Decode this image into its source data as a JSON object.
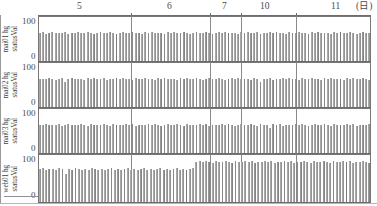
{
  "figure": {
    "kind": "multi-panel-bar-chart",
    "appearance": "grayscale scanned fax",
    "y_axis_top_label": "100",
    "y_axis_bottom_label": "0",
    "x_axis_position": "top",
    "x_axis_unit_label": "(日)"
  },
  "top_axis": {
    "ticks": [
      {
        "label": "5",
        "x": 80
      },
      {
        "label": "6",
        "x": 170
      },
      {
        "label": "7",
        "x": 225
      },
      {
        "label": "10",
        "x": 265
      },
      {
        "label": "11",
        "x": 335
      },
      {
        "label": "(日)",
        "x": 362
      }
    ],
    "gridline_positions": [
      131,
      210,
      241,
      296
    ]
  },
  "panels": [
    {
      "label_line1": "mai01 hg",
      "label_line2": "statusVal",
      "y_top": "100",
      "y_bottom": "0"
    },
    {
      "label_line1": "mai02 hg",
      "label_line2": "statusVal",
      "y_top": "100",
      "y_bottom": "0"
    },
    {
      "label_line1": "mai03 hg",
      "label_line2": "statusVal",
      "y_top": "100",
      "y_bottom": "0"
    },
    {
      "label_line1": "web01 hg",
      "label_line2": "statusVal",
      "y_top": "100",
      "y_bottom": "0"
    }
  ],
  "colors": {
    "bar_light": "#cfcfcf",
    "bar_mid": "#9a9a9a",
    "bar_dark": "#7f7f7f",
    "axis": "#777777",
    "grid": "#8a8a8a",
    "text": "#3f3f3f",
    "background": "#ffffff"
  },
  "chart_data": {
    "type": "bar",
    "title": "",
    "subtitle": "",
    "xlabel": "(日)",
    "ylabel": "statusVal",
    "ylim": [
      0,
      100
    ],
    "grid": true,
    "legend": "none",
    "x_tick_labels": [
      "5",
      "6",
      "7",
      "10",
      "11"
    ],
    "n_bars_per_panel": 104,
    "series": [
      {
        "name": "mai01 hg statusVal",
        "ylim": [
          0,
          100
        ],
        "values": [
          66,
          68,
          64,
          67,
          69,
          65,
          67,
          66,
          68,
          64,
          67,
          66,
          69,
          65,
          67,
          68,
          66,
          64,
          67,
          69,
          66,
          65,
          68,
          67,
          64,
          66,
          69,
          67,
          65,
          68,
          66,
          67,
          64,
          69,
          66,
          68,
          65,
          67,
          66,
          64,
          68,
          67,
          69,
          65,
          66,
          68,
          67,
          64,
          66,
          69,
          67,
          65,
          68,
          66,
          64,
          67,
          69,
          66,
          68,
          65,
          67,
          66,
          64,
          68,
          67,
          69,
          65,
          66,
          68,
          64,
          67,
          66,
          69,
          65,
          68,
          67,
          66,
          64,
          69,
          67,
          65,
          68,
          66,
          67,
          64,
          69,
          66,
          68,
          65,
          67,
          66,
          64,
          68,
          67,
          69,
          65,
          66,
          68,
          67,
          64,
          66,
          69,
          67,
          65
        ]
      },
      {
        "name": "mai02 hg statusVal",
        "ylim": [
          0,
          100
        ],
        "values": [
          66,
          67,
          65,
          68,
          66,
          64,
          67,
          69,
          58,
          66,
          68,
          65,
          67,
          66,
          64,
          68,
          67,
          69,
          65,
          66,
          68,
          64,
          67,
          66,
          69,
          65,
          68,
          67,
          66,
          64,
          69,
          67,
          65,
          68,
          66,
          67,
          64,
          69,
          66,
          68,
          65,
          67,
          66,
          64,
          68,
          67,
          69,
          65,
          66,
          68,
          67,
          64,
          66,
          69,
          67,
          65,
          68,
          66,
          64,
          67,
          69,
          66,
          68,
          65,
          67,
          66,
          64,
          68,
          67,
          60,
          65,
          66,
          68,
          64,
          67,
          66,
          69,
          65,
          68,
          67,
          66,
          64,
          69,
          67,
          65,
          68,
          66,
          67,
          64,
          69,
          66,
          68,
          65,
          67,
          66,
          64,
          68,
          67,
          69,
          65,
          66,
          68,
          67,
          64
        ]
      },
      {
        "name": "mai03 hg statusVal",
        "ylim": [
          0,
          100
        ],
        "values": [
          67,
          66,
          68,
          65,
          67,
          66,
          69,
          64,
          67,
          68,
          66,
          65,
          67,
          69,
          66,
          64,
          68,
          67,
          65,
          66,
          69,
          67,
          64,
          68,
          66,
          67,
          65,
          69,
          66,
          68,
          64,
          67,
          66,
          65,
          68,
          67,
          69,
          66,
          64,
          67,
          68,
          65,
          66,
          69,
          67,
          64,
          68,
          66,
          67,
          65,
          69,
          66,
          68,
          64,
          67,
          66,
          65,
          68,
          67,
          69,
          66,
          64,
          67,
          68,
          65,
          66,
          69,
          67,
          64,
          68,
          66,
          67,
          58,
          69,
          66,
          68,
          64,
          67,
          66,
          65,
          68,
          67,
          69,
          66,
          64,
          67,
          68,
          65,
          66,
          69,
          67,
          64,
          68,
          66,
          67,
          65,
          69,
          66,
          68,
          64,
          67,
          66,
          65,
          68
        ]
      },
      {
        "name": "web01 hg statusVal",
        "ylim": [
          0,
          100
        ],
        "values": [
          72,
          74,
          71,
          73,
          72,
          70,
          74,
          72,
          62,
          73,
          71,
          74,
          72,
          70,
          73,
          71,
          74,
          72,
          70,
          73,
          71,
          72,
          74,
          70,
          73,
          71,
          72,
          74,
          70,
          73,
          71,
          72,
          74,
          70,
          73,
          71,
          72,
          74,
          70,
          73,
          71,
          72,
          74,
          70,
          73,
          71,
          72,
          74,
          88,
          90,
          87,
          89,
          88,
          86,
          90,
          88,
          87,
          89,
          88,
          86,
          90,
          88,
          87,
          89,
          88,
          90,
          86,
          88,
          87,
          89,
          88,
          90,
          86,
          88,
          87,
          89,
          88,
          90,
          86,
          88,
          87,
          89,
          88,
          86,
          90,
          88,
          87,
          89,
          88,
          86,
          90,
          88,
          87,
          89,
          88,
          90,
          86,
          88,
          87,
          89,
          88,
          86
        ]
      }
    ]
  }
}
